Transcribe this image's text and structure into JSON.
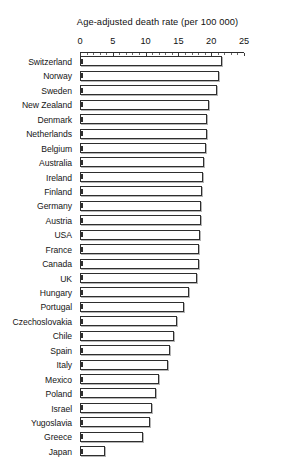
{
  "chart_data": {
    "type": "bar",
    "orientation": "horizontal",
    "title": "Age-adjusted death rate (per 100 000)",
    "xlabel": "Age-adjusted death rate (per 100 000)",
    "ylabel": "",
    "xlim": [
      0,
      25
    ],
    "xticks": [
      0,
      5,
      10,
      15,
      20,
      25
    ],
    "xtick_labels": [
      "0",
      "5",
      "10",
      "15",
      "20",
      "25"
    ],
    "grid": false,
    "legend": null,
    "axis_position": "top",
    "bar_face_color": "#ffffff",
    "bar_edge_color": "#2e2e2e",
    "categories": [
      "Switzerland",
      "Norway",
      "Sweden",
      "New Zealand",
      "Denmark",
      "Netherlands",
      "Belgium",
      "Australia",
      "Ireland",
      "Finland",
      "Germany",
      "Austria",
      "USA",
      "France",
      "Canada",
      "UK",
      "Hungary",
      "Portugal",
      "Czechoslovakia",
      "Chile",
      "Spain",
      "Italy",
      "Mexico",
      "Poland",
      "Israel",
      "Yugoslavia",
      "Greece",
      "Japan"
    ],
    "values": [
      21.7,
      21.2,
      20.9,
      19.6,
      19.4,
      19.3,
      19.2,
      18.9,
      18.8,
      18.6,
      18.5,
      18.4,
      18.3,
      18.2,
      18.1,
      17.9,
      16.6,
      15.9,
      14.8,
      14.3,
      13.7,
      13.4,
      12.1,
      11.6,
      11.0,
      10.6,
      9.6,
      3.8
    ]
  }
}
